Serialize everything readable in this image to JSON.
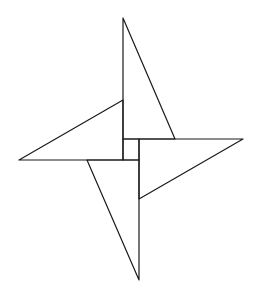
{
  "figure": {
    "title": "",
    "stroke_color": "#1a1a1a",
    "background_color": "#ffffff",
    "shapes": [
      {
        "name": "top-triangle",
        "type": "triangle"
      },
      {
        "name": "left-triangle",
        "type": "triangle"
      },
      {
        "name": "right-triangle",
        "type": "triangle"
      },
      {
        "name": "bottom-triangle",
        "type": "triangle"
      },
      {
        "name": "center-square",
        "type": "square"
      }
    ]
  }
}
